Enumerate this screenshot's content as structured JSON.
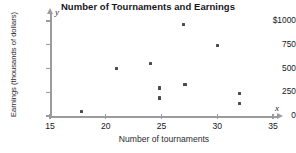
{
  "chart_data": {
    "type": "scatter",
    "title": "Number of Tournaments and Earnings",
    "xlabel": "Number of tournaments",
    "ylabel": "Earnings (thousands of dollars)",
    "x_axis_letter": "x",
    "y_axis_letter": "y",
    "xlim": [
      15,
      35
    ],
    "ylim": [
      0,
      1000
    ],
    "xticks": [
      15,
      20,
      25,
      30,
      35
    ],
    "xtick_labels": [
      "15",
      "20",
      "25",
      "30",
      "35"
    ],
    "yticks": [
      0,
      250,
      500,
      750,
      1000
    ],
    "ytick_labels": [
      "0",
      "250",
      "500",
      "750",
      "$1000"
    ],
    "grid": false,
    "legend": false,
    "marker": "square",
    "marker_color": "#4a4a52",
    "axis_color": "#9b9b9f",
    "points": [
      {
        "x": 17.8,
        "y": 50
      },
      {
        "x": 21.0,
        "y": 500
      },
      {
        "x": 24.0,
        "y": 550
      },
      {
        "x": 24.8,
        "y": 295
      },
      {
        "x": 24.8,
        "y": 190
      },
      {
        "x": 27.0,
        "y": 960
      },
      {
        "x": 27.1,
        "y": 335
      },
      {
        "x": 30.0,
        "y": 745
      },
      {
        "x": 32.0,
        "y": 235
      },
      {
        "x": 32.0,
        "y": 130
      }
    ]
  }
}
